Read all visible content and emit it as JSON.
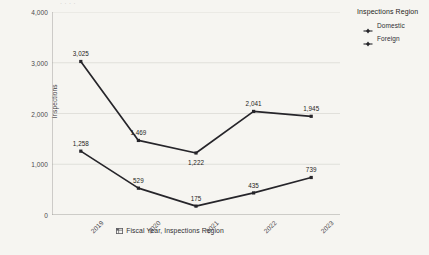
{
  "top_remnant": "· · · ·",
  "legend": {
    "title": "Inspections Region",
    "items": [
      {
        "label": "Domestic",
        "marker": "diamond-marker-icon"
      },
      {
        "label": "Foreign",
        "marker": "diamond-marker-icon"
      }
    ]
  },
  "axes": {
    "y_title": "Inspections",
    "x_title": "Fiscal Year, Inspections Region",
    "x_title_icon": "table-grid-icon"
  },
  "colors": {
    "background": "#f6f5f1",
    "line": "#26252a",
    "grid": "#dcdad5",
    "axis": "#9b9a96",
    "text": "#2f2e32"
  },
  "chart_data": {
    "type": "line",
    "title": "",
    "xlabel": "Fiscal Year, Inspections Region",
    "ylabel": "Inspections",
    "categories": [
      "2019",
      "2020",
      "2021",
      "2022",
      "2023"
    ],
    "ylim": [
      0,
      4000
    ],
    "yticks": [
      0,
      1000,
      2000,
      3000,
      4000
    ],
    "ytick_labels": [
      "0",
      "1,000",
      "2,000",
      "3,000",
      "4,000"
    ],
    "grid": true,
    "legend_position": "right",
    "series": [
      {
        "name": "Domestic",
        "values": [
          1258,
          529,
          175,
          435,
          739
        ],
        "labels": [
          "1,258",
          "529",
          "175",
          "435",
          "739"
        ],
        "label_positions": [
          "above",
          "above",
          "above",
          "above",
          "above"
        ]
      },
      {
        "name": "Foreign",
        "values": [
          3025,
          1469,
          1222,
          2041,
          1945
        ],
        "labels": [
          "3,025",
          "1,469",
          "1,222",
          "2,041",
          "1,945"
        ],
        "label_positions": [
          "above",
          "above",
          "below",
          "above",
          "above"
        ]
      }
    ]
  }
}
